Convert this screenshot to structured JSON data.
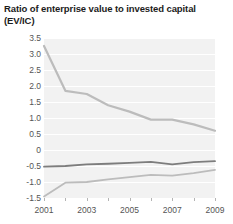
{
  "chart_data": {
    "type": "line",
    "title": "Ratio of enterprise value to invested capital (EV/IC)",
    "xlabel": "",
    "ylabel": "",
    "grid": true,
    "legend": "none",
    "plot_background": "#f2f2f2",
    "gridline_color": "#ffffff",
    "x": [
      2001,
      2002,
      2003,
      2004,
      2005,
      2006,
      2007,
      2008,
      2009
    ],
    "xlim": [
      2001,
      2009
    ],
    "ylim": [
      -1.5,
      3.5
    ],
    "ytick_step": 0.5,
    "x_tick_labels": [
      "2001",
      "2003",
      "2005",
      "2007",
      "2009"
    ],
    "x_tick_label_values": [
      2001,
      2003,
      2005,
      2007,
      2009
    ],
    "y_tick_labels": [
      "3.5",
      "3.0",
      "2.5",
      "2.0",
      "1.5",
      "1.0",
      "0.5",
      "0",
      "-0.5",
      "-1.0",
      "-1.5"
    ],
    "y_tick_values": [
      3.5,
      3.0,
      2.5,
      2.0,
      1.5,
      1.0,
      0.5,
      0,
      -0.5,
      -1.0,
      -1.5
    ],
    "series": [
      {
        "name": "upper",
        "color": "#bcbcbc",
        "width": 2.2,
        "values": [
          3.25,
          1.85,
          1.75,
          1.4,
          1.2,
          0.95,
          0.95,
          0.8,
          0.6
        ]
      },
      {
        "name": "middle",
        "color": "#7d7d7d",
        "width": 1.8,
        "values": [
          -0.52,
          -0.5,
          -0.45,
          -0.43,
          -0.4,
          -0.37,
          -0.45,
          -0.38,
          -0.35
        ]
      },
      {
        "name": "lower",
        "color": "#bcbcbc",
        "width": 1.8,
        "values": [
          -1.45,
          -1.02,
          -1.0,
          -0.92,
          -0.85,
          -0.78,
          -0.8,
          -0.72,
          -0.62
        ]
      }
    ]
  }
}
